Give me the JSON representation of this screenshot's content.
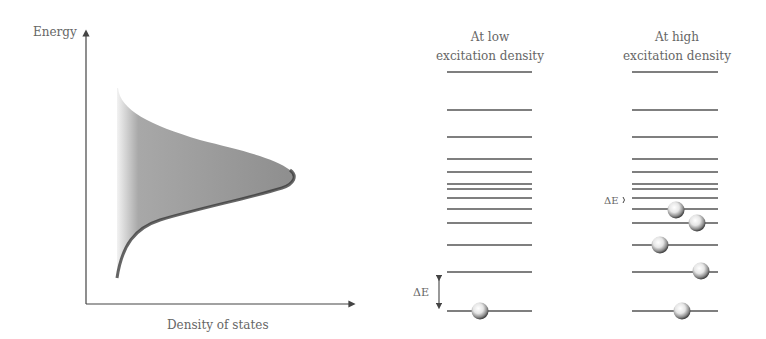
{
  "left_panel": {
    "y_axis_label": "Energy",
    "x_axis_label": "Density of states"
  },
  "middle_panel": {
    "title_line1": "At low",
    "title_line2": "excitation density",
    "delta_label": "ΔE",
    "levels_y": [
      72,
      110,
      137,
      159,
      172,
      184,
      189,
      198,
      209,
      223,
      245,
      272,
      311
    ],
    "particles": [
      {
        "x": 480,
        "y": 311
      }
    ]
  },
  "right_panel": {
    "title_line1": "At high",
    "title_line2": "excitation density",
    "delta_label": "ΔE",
    "levels_y": [
      72,
      110,
      137,
      159,
      172,
      184,
      189,
      198,
      209,
      223,
      245,
      272,
      311
    ],
    "particles": [
      {
        "x": 676,
        "y": 210
      },
      {
        "x": 697,
        "y": 223
      },
      {
        "x": 660,
        "y": 245
      },
      {
        "x": 701,
        "y": 271
      },
      {
        "x": 682,
        "y": 311
      }
    ]
  },
  "colors": {
    "line": "#555555",
    "fill": "#9a9a9a",
    "edge": "#333333"
  }
}
